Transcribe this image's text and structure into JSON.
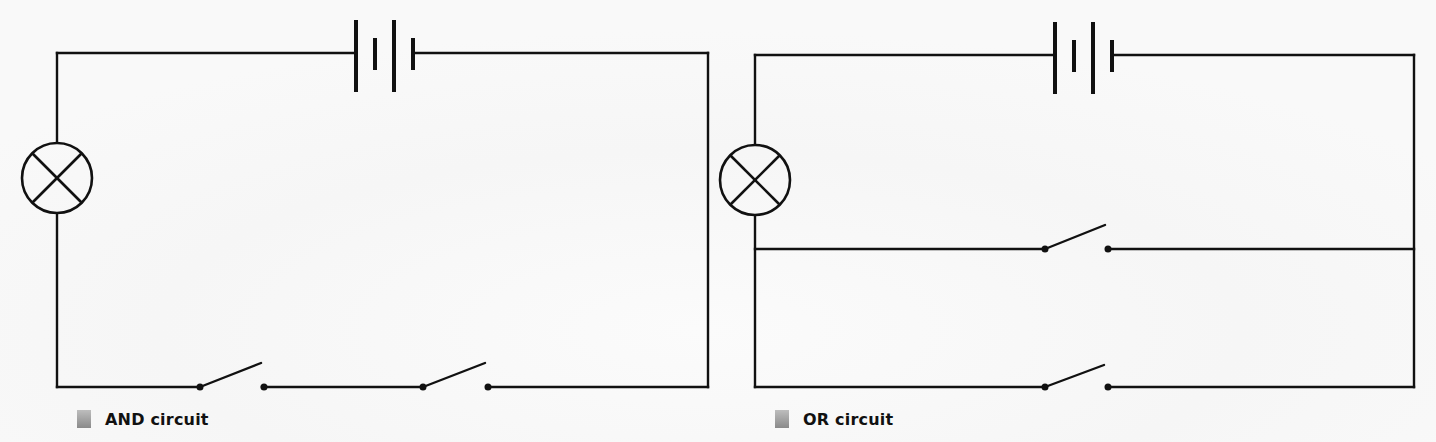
{
  "diagram": {
    "type": "circuit-schematics",
    "colors": {
      "wire": "#111111",
      "background": "#ffffff",
      "caption_swatch_top": "#bdbdbd",
      "caption_swatch_bottom": "#8a8a8a"
    },
    "circuits": [
      {
        "id": "and",
        "caption": "AND circuit",
        "components": [
          "battery",
          "lamp",
          "switch",
          "switch"
        ],
        "arrangement": "lamp and two switches in series with battery"
      },
      {
        "id": "or",
        "caption": "OR circuit",
        "components": [
          "battery",
          "lamp",
          "switch",
          "switch"
        ],
        "arrangement": "lamp in series with two switches in parallel"
      }
    ]
  }
}
